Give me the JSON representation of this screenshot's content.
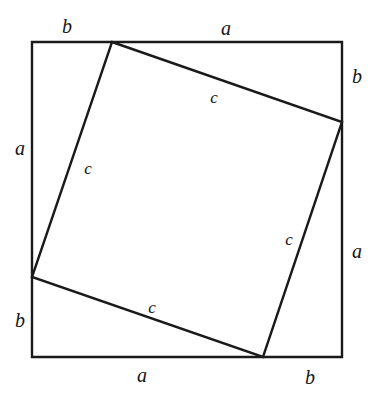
{
  "figure": {
    "background_color": "#ffffff",
    "stroke_color": "#1a1a1a",
    "outer_square_stroke_width": 2.4,
    "inner_square_stroke_width": 2.4,
    "canvas": {
      "width": 384,
      "height": 396
    }
  },
  "geometry": {
    "outer_square": {
      "name": "outer-square",
      "left": 32,
      "top": 42,
      "right": 342,
      "bottom": 357,
      "points": "32,42 342,42 342,357 32,357"
    },
    "inner_square": {
      "name": "inner-square",
      "points": "112,42 342,122 263,357 32,277",
      "vertices": [
        {
          "name": "top-vertex",
          "x": 112,
          "y": 42
        },
        {
          "name": "right-vertex",
          "x": 342,
          "y": 122
        },
        {
          "name": "bottom-vertex",
          "x": 263,
          "y": 357
        },
        {
          "name": "left-vertex",
          "x": 32,
          "y": 277
        }
      ]
    }
  },
  "labels": {
    "outer": [
      {
        "id": "b-top-left",
        "text": "b",
        "x": 67,
        "y": 26
      },
      {
        "id": "a-top",
        "text": "a",
        "x": 226,
        "y": 28
      },
      {
        "id": "b-right-top",
        "text": "b",
        "x": 357,
        "y": 76
      },
      {
        "id": "a-left",
        "text": "a",
        "x": 20,
        "y": 148
      },
      {
        "id": "a-right-bottom",
        "text": "a",
        "x": 357,
        "y": 251
      },
      {
        "id": "b-left-bottom",
        "text": "b",
        "x": 20,
        "y": 320
      },
      {
        "id": "a-bottom",
        "text": "a",
        "x": 142,
        "y": 375
      },
      {
        "id": "b-bottom-right",
        "text": "b",
        "x": 310,
        "y": 377
      }
    ],
    "inner": [
      {
        "id": "c-top-right",
        "text": "c",
        "x": 214,
        "y": 97
      },
      {
        "id": "c-top-left",
        "text": "c",
        "x": 88,
        "y": 168
      },
      {
        "id": "c-bottom-right",
        "text": "c",
        "x": 289,
        "y": 239
      },
      {
        "id": "c-bottom-left",
        "text": "c",
        "x": 152,
        "y": 307
      }
    ]
  },
  "legend": {
    "side_a": "a",
    "side_b": "b",
    "hypotenuse_c": "c"
  }
}
